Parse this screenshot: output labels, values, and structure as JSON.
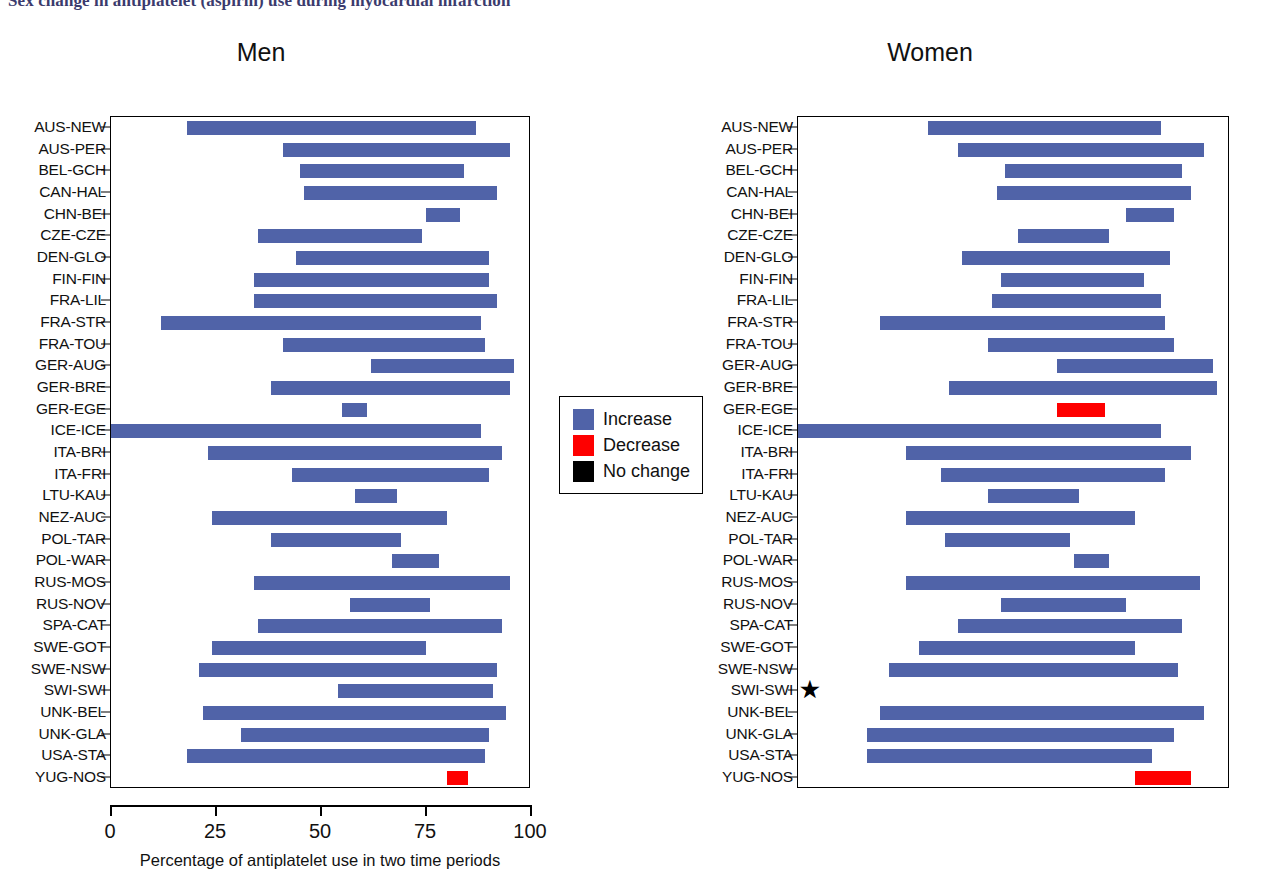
{
  "figure": {
    "title": "Sex change in antiplatelet (aspirin) use during myocardial infarction",
    "panels": [
      {
        "key": "men",
        "title": "Men"
      },
      {
        "key": "women",
        "title": "Women"
      }
    ],
    "xlabel": "Percentage of antiplatelet use in two time periods",
    "xticks": [
      "0",
      "25",
      "50",
      "75",
      "100"
    ],
    "footnote_marker": "★"
  },
  "legend": {
    "items": [
      {
        "label": "Increase",
        "color": "#5063a8",
        "key": "increase"
      },
      {
        "label": "Decrease",
        "color": "#fe0000",
        "key": "decrease"
      },
      {
        "label": "No change",
        "color": "#000000",
        "key": "nochange"
      }
    ]
  },
  "chart_data": {
    "type": "bar",
    "orientation": "horizontal",
    "title": "Sex change in antiplatelet (aspirin) use during myocardial infarction",
    "xlabel": "Percentage of antiplatelet use in two time periods",
    "ylabel": "",
    "xlim": [
      0,
      100
    ],
    "xticks": [
      0,
      25,
      50,
      75,
      100
    ],
    "grid": false,
    "legend": {
      "position": "center",
      "entries": [
        "Increase",
        "Decrease",
        "No change"
      ]
    },
    "note": "Each bar is a floating range spanning the percentage of antiplatelet use in the earlier time period to the later time period. Colour encodes direction of change.",
    "categories": [
      "AUS-NEW",
      "AUS-PER",
      "BEL-GCH",
      "CAN-HAL",
      "CHN-BEI",
      "CZE-CZE",
      "DEN-GLO",
      "FIN-FIN",
      "FRA-LIL",
      "FRA-STR",
      "FRA-TOU",
      "GER-AUG",
      "GER-BRE",
      "GER-EGE",
      "ICE-ICE",
      "ITA-BRI",
      "ITA-FRI",
      "LTU-KAU",
      "NEZ-AUC",
      "POL-TAR",
      "POL-WAR",
      "RUS-MOS",
      "RUS-NOV",
      "SPA-CAT",
      "SWE-GOT",
      "SWE-NSW",
      "SWI-SWI",
      "UNK-BEL",
      "UNK-GLA",
      "USA-STA",
      "YUG-NOS"
    ],
    "series": [
      {
        "name": "Men",
        "panel": "men",
        "bars": [
          {
            "category": "AUS-NEW",
            "start": 18,
            "end": 87,
            "change": "increase"
          },
          {
            "category": "AUS-PER",
            "start": 41,
            "end": 95,
            "change": "increase"
          },
          {
            "category": "BEL-GCH",
            "start": 45,
            "end": 84,
            "change": "increase"
          },
          {
            "category": "CAN-HAL",
            "start": 46,
            "end": 92,
            "change": "increase"
          },
          {
            "category": "CHN-BEI",
            "start": 75,
            "end": 83,
            "change": "increase"
          },
          {
            "category": "CZE-CZE",
            "start": 35,
            "end": 74,
            "change": "increase"
          },
          {
            "category": "DEN-GLO",
            "start": 44,
            "end": 90,
            "change": "increase"
          },
          {
            "category": "FIN-FIN",
            "start": 34,
            "end": 90,
            "change": "increase"
          },
          {
            "category": "FRA-LIL",
            "start": 34,
            "end": 92,
            "change": "increase"
          },
          {
            "category": "FRA-STR",
            "start": 12,
            "end": 88,
            "change": "increase"
          },
          {
            "category": "FRA-TOU",
            "start": 41,
            "end": 89,
            "change": "increase"
          },
          {
            "category": "GER-AUG",
            "start": 62,
            "end": 96,
            "change": "increase"
          },
          {
            "category": "GER-BRE",
            "start": 38,
            "end": 95,
            "change": "increase"
          },
          {
            "category": "GER-EGE",
            "start": 55,
            "end": 61,
            "change": "increase"
          },
          {
            "category": "ICE-ICE",
            "start": 0,
            "end": 88,
            "change": "increase"
          },
          {
            "category": "ITA-BRI",
            "start": 23,
            "end": 93,
            "change": "increase"
          },
          {
            "category": "ITA-FRI",
            "start": 43,
            "end": 90,
            "change": "increase"
          },
          {
            "category": "LTU-KAU",
            "start": 58,
            "end": 68,
            "change": "increase"
          },
          {
            "category": "NEZ-AUC",
            "start": 24,
            "end": 80,
            "change": "increase"
          },
          {
            "category": "POL-TAR",
            "start": 38,
            "end": 69,
            "change": "increase"
          },
          {
            "category": "POL-WAR",
            "start": 67,
            "end": 78,
            "change": "increase"
          },
          {
            "category": "RUS-MOS",
            "start": 34,
            "end": 95,
            "change": "increase"
          },
          {
            "category": "RUS-NOV",
            "start": 57,
            "end": 76,
            "change": "increase"
          },
          {
            "category": "SPA-CAT",
            "start": 35,
            "end": 93,
            "change": "increase"
          },
          {
            "category": "SWE-GOT",
            "start": 24,
            "end": 75,
            "change": "increase"
          },
          {
            "category": "SWE-NSW",
            "start": 21,
            "end": 92,
            "change": "increase"
          },
          {
            "category": "SWI-SWI",
            "start": 54,
            "end": 91,
            "change": "increase"
          },
          {
            "category": "UNK-BEL",
            "start": 22,
            "end": 94,
            "change": "increase"
          },
          {
            "category": "UNK-GLA",
            "start": 31,
            "end": 90,
            "change": "increase"
          },
          {
            "category": "USA-STA",
            "start": 18,
            "end": 89,
            "change": "increase"
          },
          {
            "category": "YUG-NOS",
            "start": 80,
            "end": 85,
            "change": "decrease"
          }
        ]
      },
      {
        "name": "Women",
        "panel": "women",
        "bars": [
          {
            "category": "AUS-NEW",
            "start": 30,
            "end": 84,
            "change": "increase"
          },
          {
            "category": "AUS-PER",
            "start": 37,
            "end": 94,
            "change": "increase"
          },
          {
            "category": "BEL-GCH",
            "start": 48,
            "end": 89,
            "change": "increase"
          },
          {
            "category": "CAN-HAL",
            "start": 46,
            "end": 91,
            "change": "increase"
          },
          {
            "category": "CHN-BEI",
            "start": 76,
            "end": 87,
            "change": "increase"
          },
          {
            "category": "CZE-CZE",
            "start": 51,
            "end": 72,
            "change": "increase"
          },
          {
            "category": "DEN-GLO",
            "start": 38,
            "end": 86,
            "change": "increase"
          },
          {
            "category": "FIN-FIN",
            "start": 47,
            "end": 80,
            "change": "increase"
          },
          {
            "category": "FRA-LIL",
            "start": 45,
            "end": 84,
            "change": "increase"
          },
          {
            "category": "FRA-STR",
            "start": 19,
            "end": 85,
            "change": "increase"
          },
          {
            "category": "FRA-TOU",
            "start": 44,
            "end": 87,
            "change": "increase"
          },
          {
            "category": "GER-AUG",
            "start": 60,
            "end": 96,
            "change": "increase"
          },
          {
            "category": "GER-BRE",
            "start": 35,
            "end": 97,
            "change": "increase"
          },
          {
            "category": "GER-EGE",
            "start": 60,
            "end": 71,
            "change": "decrease"
          },
          {
            "category": "ICE-ICE",
            "start": 0,
            "end": 84,
            "change": "increase"
          },
          {
            "category": "ITA-BRI",
            "start": 25,
            "end": 91,
            "change": "increase"
          },
          {
            "category": "ITA-FRI",
            "start": 33,
            "end": 85,
            "change": "increase"
          },
          {
            "category": "LTU-KAU",
            "start": 44,
            "end": 65,
            "change": "increase"
          },
          {
            "category": "NEZ-AUC",
            "start": 25,
            "end": 78,
            "change": "increase"
          },
          {
            "category": "POL-TAR",
            "start": 34,
            "end": 63,
            "change": "increase"
          },
          {
            "category": "POL-WAR",
            "start": 64,
            "end": 72,
            "change": "increase"
          },
          {
            "category": "RUS-MOS",
            "start": 25,
            "end": 93,
            "change": "increase"
          },
          {
            "category": "RUS-NOV",
            "start": 47,
            "end": 76,
            "change": "increase"
          },
          {
            "category": "SPA-CAT",
            "start": 37,
            "end": 89,
            "change": "increase"
          },
          {
            "category": "SWE-GOT",
            "start": 28,
            "end": 78,
            "change": "increase"
          },
          {
            "category": "SWE-NSW",
            "start": 21,
            "end": 88,
            "change": "increase"
          },
          {
            "category": "SWI-SWI",
            "start": null,
            "end": null,
            "change": "none"
          },
          {
            "category": "UNK-BEL",
            "start": 19,
            "end": 94,
            "change": "increase"
          },
          {
            "category": "UNK-GLA",
            "start": 16,
            "end": 87,
            "change": "increase"
          },
          {
            "category": "USA-STA",
            "start": 16,
            "end": 82,
            "change": "increase"
          },
          {
            "category": "YUG-NOS",
            "start": 78,
            "end": 91,
            "change": "decrease"
          }
        ]
      }
    ]
  }
}
